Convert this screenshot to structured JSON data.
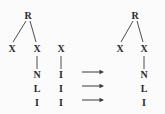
{
  "diagram": {
    "type": "tree-rewrite",
    "background_color": "#fbfbfb",
    "ink_color": "#2a2a2a",
    "left_tree": {
      "name": "source-tree",
      "root": {
        "label": "R",
        "x": 28,
        "y": 15
      },
      "children": [
        {
          "label": "X",
          "x": 12,
          "y": 49
        },
        {
          "label": "X",
          "x": 37,
          "y": 49
        }
      ],
      "spine_from_second_x": [
        {
          "label": "N",
          "x": 37,
          "y": 75
        },
        {
          "label": "L",
          "x": 37,
          "y": 89
        },
        {
          "label": "I",
          "x": 37,
          "y": 103
        }
      ],
      "detached_branch": {
        "name": "detached-x-column",
        "head": {
          "label": "X",
          "x": 61,
          "y": 49
        },
        "spine": [
          {
            "label": "I",
            "x": 61,
            "y": 75
          },
          {
            "label": "I",
            "x": 61,
            "y": 89
          },
          {
            "label": "I",
            "x": 61,
            "y": 103
          }
        ]
      }
    },
    "arrows": [
      {
        "name": "rewrite-arrow-1",
        "glyph": "→",
        "x1": 82,
        "x2": 104,
        "y": 72
      },
      {
        "name": "rewrite-arrow-2",
        "glyph": "→",
        "x1": 82,
        "x2": 104,
        "y": 86
      },
      {
        "name": "rewrite-arrow-3",
        "glyph": "→",
        "x1": 82,
        "x2": 104,
        "y": 100
      }
    ],
    "right_tree": {
      "name": "result-tree",
      "root": {
        "label": "R",
        "x": 135,
        "y": 15
      },
      "children": [
        {
          "label": "X",
          "x": 120,
          "y": 49
        },
        {
          "label": "X",
          "x": 144,
          "y": 49
        }
      ],
      "spine_from_second_x": [
        {
          "label": "N",
          "x": 144,
          "y": 75
        },
        {
          "label": "L",
          "x": 144,
          "y": 89
        },
        {
          "label": "I",
          "x": 144,
          "y": 103
        }
      ]
    }
  }
}
